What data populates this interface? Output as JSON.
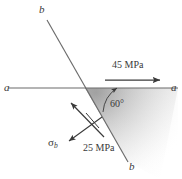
{
  "figure": {
    "colors": {
      "line": "#6b6b6b",
      "arrow": "#3a3a3a",
      "text": "#3a3a3a",
      "wedge_fill_dark": "#a9a9a9",
      "wedge_fill_light": "#ffffff",
      "background": "#ffffff"
    },
    "labels": {
      "axis_a_left": "a",
      "axis_a_right": "a",
      "axis_b_top": "b",
      "axis_b_bottom": "b",
      "angle": "60°",
      "normal_stress": "45 MPa",
      "shear_stress": "25 MPa",
      "sigma_symbol": "σ",
      "sigma_subscript": "b"
    },
    "geometry": {
      "intersection_x": 85,
      "intersection_y": 88,
      "angle_degrees": 60,
      "axis_a_y": 88,
      "axis_a_x_start": 8,
      "axis_a_x_end": 178,
      "axis_b_x_top": 47,
      "axis_b_y_top": 20,
      "axis_b_x_bottom": 128,
      "axis_b_y_bottom": 162
    },
    "arrows": {
      "tension_from_x": 105,
      "tension_from_y": 80,
      "tension_to_x": 161,
      "tension_to_y": 80,
      "shear_from_x": 105,
      "shear_from_y": 138,
      "shear_to_x": 70,
      "shear_to_y": 102,
      "sigma_from_x": 103,
      "sigma_from_y": 118,
      "sigma_to_x": 68,
      "sigma_to_y": 142
    }
  }
}
